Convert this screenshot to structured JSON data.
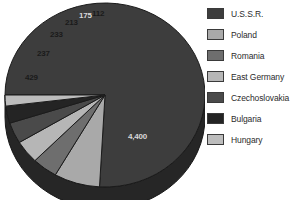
{
  "chart_data": {
    "type": "pie",
    "title": "",
    "subtitle": "",
    "xlabel": "",
    "ylabel": "",
    "legend_position": "right",
    "grid": false,
    "three_d": true,
    "labels_shown_on_slices": true,
    "categories": [
      "U.S.S.R.",
      "Poland",
      "Romania",
      "East Germany",
      "Czechoslovakia",
      "Bulgaria",
      "Hungary"
    ],
    "values": [
      4400,
      429,
      237,
      233,
      213,
      175,
      112
    ],
    "value_labels": [
      "4,400",
      "429",
      "237",
      "233",
      "213",
      "175",
      "112"
    ],
    "colors": [
      "#3d3d3d",
      "#a9a9a9",
      "#6e6e6e",
      "#b6b6b6",
      "#4a4a4a",
      "#242424",
      "#bdbdbd"
    ]
  },
  "legend": {
    "items": [
      {
        "label": "U.S.S.R.",
        "color": "#3d3d3d"
      },
      {
        "label": "Poland",
        "color": "#a9a9a9"
      },
      {
        "label": "Romania",
        "color": "#6e6e6e"
      },
      {
        "label": "East Germany",
        "color": "#b6b6b6"
      },
      {
        "label": "Czechoslovakia",
        "color": "#4a4a4a"
      },
      {
        "label": "Bulgaria",
        "color": "#242424"
      },
      {
        "label": "Hungary",
        "color": "#bdbdbd"
      }
    ]
  },
  "slice_labels": [
    {
      "text": "4,400",
      "x": 128,
      "y": 133,
      "tone": "on-dark"
    },
    {
      "text": "429",
      "x": 25,
      "y": 74,
      "tone": "on-light"
    },
    {
      "text": "237",
      "x": 37,
      "y": 50,
      "tone": "on-light"
    },
    {
      "text": "233",
      "x": 50,
      "y": 31,
      "tone": "on-light"
    },
    {
      "text": "213",
      "x": 65,
      "y": 19,
      "tone": "on-light"
    },
    {
      "text": "175",
      "x": 79,
      "y": 12,
      "tone": "on-dark"
    },
    {
      "text": "112",
      "x": 92,
      "y": 10,
      "tone": "on-light"
    }
  ]
}
